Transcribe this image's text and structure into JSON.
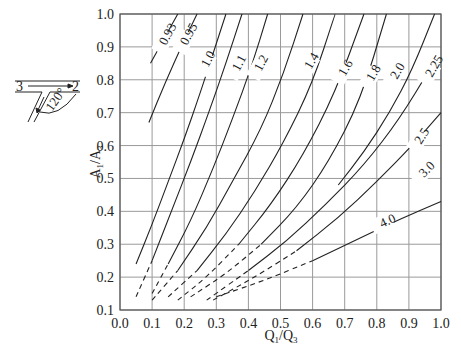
{
  "chart_data": {
    "type": "line",
    "title": "",
    "xlabel": "Q1/Q3",
    "ylabel": "A1/A3",
    "xlim": [
      0.0,
      1.0
    ],
    "ylim": [
      0.1,
      1.0
    ],
    "grid": true,
    "x_ticks": [
      "0.0",
      "0.1",
      "0.2",
      "0.3",
      "0.4",
      "0.5",
      "0.6",
      "0.7",
      "0.8",
      "0.9",
      "1.0"
    ],
    "y_ticks": [
      "0.1",
      "0.2",
      "0.3",
      "0.4",
      "0.5",
      "0.6",
      "0.7",
      "0.8",
      "0.9",
      "1.0"
    ],
    "legend": "none (curves labeled inline)",
    "series": [
      {
        "name": "0.93",
        "points": [
          [
            0.095,
            0.85
          ],
          [
            0.14,
            0.93
          ],
          [
            0.18,
            1.0
          ]
        ]
      },
      {
        "name": "0.95",
        "points": [
          [
            0.09,
            0.67
          ],
          [
            0.14,
            0.79
          ],
          [
            0.2,
            0.92
          ],
          [
            0.24,
            1.0
          ]
        ]
      },
      {
        "name": "1.0",
        "points": [
          [
            0.05,
            0.24
          ],
          [
            0.1,
            0.36
          ],
          [
            0.15,
            0.49
          ],
          [
            0.2,
            0.62
          ],
          [
            0.25,
            0.76
          ],
          [
            0.29,
            0.88
          ],
          [
            0.33,
            1.0
          ]
        ]
      },
      {
        "name": "1.1",
        "points": [
          [
            0.05,
            0.14
          ],
          [
            0.1,
            0.25
          ],
          [
            0.16,
            0.4
          ],
          [
            0.22,
            0.55
          ],
          [
            0.28,
            0.71
          ],
          [
            0.33,
            0.85
          ],
          [
            0.38,
            1.0
          ]
        ]
      },
      {
        "name": "1.2",
        "points": [
          [
            0.1,
            0.15
          ],
          [
            0.15,
            0.24
          ],
          [
            0.22,
            0.37
          ],
          [
            0.29,
            0.53
          ],
          [
            0.35,
            0.68
          ],
          [
            0.41,
            0.84
          ],
          [
            0.46,
            1.0
          ]
        ]
      },
      {
        "name": "1.4",
        "points": [
          [
            0.1,
            0.13
          ],
          [
            0.18,
            0.22
          ],
          [
            0.27,
            0.35
          ],
          [
            0.35,
            0.49
          ],
          [
            0.44,
            0.65
          ],
          [
            0.51,
            0.82
          ],
          [
            0.57,
            1.0
          ]
        ]
      },
      {
        "name": "1.6",
        "points": [
          [
            0.15,
            0.14
          ],
          [
            0.24,
            0.22
          ],
          [
            0.33,
            0.33
          ],
          [
            0.42,
            0.46
          ],
          [
            0.51,
            0.61
          ],
          [
            0.6,
            0.79
          ],
          [
            0.67,
            1.0
          ]
        ]
      },
      {
        "name": "1.8",
        "points": [
          [
            0.18,
            0.13
          ],
          [
            0.27,
            0.2
          ],
          [
            0.37,
            0.3
          ],
          [
            0.47,
            0.42
          ],
          [
            0.57,
            0.57
          ],
          [
            0.67,
            0.76
          ],
          [
            0.76,
            1.0
          ]
        ]
      },
      {
        "name": "2.0",
        "points": [
          [
            0.22,
            0.14
          ],
          [
            0.33,
            0.21
          ],
          [
            0.44,
            0.3
          ],
          [
            0.55,
            0.41
          ],
          [
            0.65,
            0.55
          ],
          [
            0.75,
            0.74
          ],
          [
            0.83,
            1.0
          ]
        ]
      },
      {
        "name": "2.25",
        "points": [
          [
            0.68,
            0.48
          ],
          [
            0.76,
            0.58
          ],
          [
            0.84,
            0.7
          ],
          [
            0.91,
            0.83
          ],
          [
            0.98,
            1.0
          ]
        ]
      },
      {
        "name": "2.5",
        "points": [
          [
            0.27,
            0.13
          ],
          [
            0.4,
            0.22
          ],
          [
            0.52,
            0.31
          ],
          [
            0.64,
            0.42
          ],
          [
            0.76,
            0.54
          ],
          [
            0.87,
            0.68
          ],
          [
            0.97,
            0.84
          ]
        ]
      },
      {
        "name": "3.0",
        "points": [
          [
            0.29,
            0.13
          ],
          [
            0.42,
            0.2
          ],
          [
            0.55,
            0.28
          ],
          [
            0.68,
            0.38
          ],
          [
            0.8,
            0.49
          ],
          [
            0.91,
            0.6
          ],
          [
            1.0,
            0.7
          ]
        ]
      },
      {
        "name": "4.0",
        "points": [
          [
            0.3,
            0.14
          ],
          [
            0.45,
            0.19
          ],
          [
            0.6,
            0.25
          ],
          [
            0.75,
            0.32
          ],
          [
            0.88,
            0.38
          ],
          [
            1.0,
            0.43
          ]
        ]
      }
    ],
    "dashed_extensions_below_approx": 0.22,
    "annotations": [
      "0.93",
      "0.95",
      "1.0",
      "1.1",
      "1.2",
      "1.4",
      "1.6",
      "1.8",
      "2.0",
      "2.25",
      "2.5",
      "3.0",
      "4.0"
    ]
  },
  "inset": {
    "branch_in": "3",
    "branch_out": "2",
    "angle": "120°"
  }
}
